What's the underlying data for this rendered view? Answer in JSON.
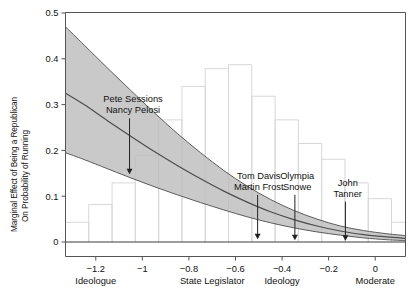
{
  "chart_data": {
    "type": "line",
    "title": "",
    "subtitle": "",
    "xlabel": "Ideology",
    "ylabel_line1": "Marginal Effect of Being a Republican",
    "ylabel_line2": "On Probability of Running",
    "xlim": [
      -1.33,
      0.13
    ],
    "ylim": [
      0,
      0.5
    ],
    "grid": false,
    "legend": "none",
    "xticks": [
      -1.2,
      -1,
      -0.8,
      -0.6,
      -0.4,
      -0.2,
      0
    ],
    "xticklabels": [
      "−1.2",
      "−1",
      "−0.8",
      "−0.6",
      "−0.4",
      "−0.2",
      "0"
    ],
    "yticks": [
      0,
      0.1,
      0.2,
      0.3,
      0.4,
      0.5
    ],
    "yticklabels": [
      "0",
      "0.1",
      "0.2",
      "0.3",
      "0.4",
      "0.5"
    ],
    "x_anchor_labels": [
      {
        "text": "Ideologue",
        "x": -1.2
      },
      {
        "text": "State Legislator",
        "x": -0.7
      },
      {
        "text": "Moderate",
        "x": 0.0
      }
    ],
    "series": [
      {
        "name": "Marginal effect (point estimate)",
        "x": [
          -1.33,
          -1.25,
          -1.15,
          -1.05,
          -0.95,
          -0.85,
          -0.75,
          -0.65,
          -0.55,
          -0.45,
          -0.35,
          -0.25,
          -0.15,
          -0.05,
          0.05,
          0.13
        ],
        "values": [
          0.325,
          0.3,
          0.265,
          0.231,
          0.198,
          0.167,
          0.138,
          0.111,
          0.087,
          0.066,
          0.049,
          0.035,
          0.024,
          0.016,
          0.011,
          0.008
        ]
      },
      {
        "name": "95% CI upper",
        "x": [
          -1.33,
          -1.25,
          -1.15,
          -1.05,
          -0.95,
          -0.85,
          -0.75,
          -0.65,
          -0.55,
          -0.45,
          -0.35,
          -0.25,
          -0.15,
          -0.05,
          0.05,
          0.13
        ],
        "values": [
          0.47,
          0.43,
          0.38,
          0.331,
          0.283,
          0.237,
          0.195,
          0.156,
          0.122,
          0.093,
          0.069,
          0.05,
          0.035,
          0.025,
          0.018,
          0.014
        ]
      },
      {
        "name": "95% CI lower",
        "x": [
          -1.33,
          -1.25,
          -1.15,
          -1.05,
          -0.95,
          -0.85,
          -0.75,
          -0.65,
          -0.55,
          -0.45,
          -0.35,
          -0.25,
          -0.15,
          -0.05,
          0.05,
          0.13
        ],
        "values": [
          0.195,
          0.18,
          0.16,
          0.14,
          0.121,
          0.103,
          0.086,
          0.07,
          0.055,
          0.042,
          0.031,
          0.022,
          0.015,
          0.009,
          0.005,
          0.003
        ]
      }
    ],
    "histogram": {
      "name": "Distribution of ideology scores",
      "note": "background frequency histogram, unlabeled secondary axis",
      "bin_edges": [
        -1.33,
        -1.23,
        -1.13,
        -1.03,
        -0.93,
        -0.83,
        -0.73,
        -0.63,
        -0.53,
        -0.43,
        -0.33,
        -0.23,
        -0.13,
        -0.03,
        0.07,
        0.13
      ],
      "bin_heights_rel": [
        0.1,
        0.19,
        0.3,
        0.44,
        0.62,
        0.79,
        0.88,
        0.9,
        0.74,
        0.62,
        0.5,
        0.42,
        0.3,
        0.22,
        0.1
      ]
    },
    "annotations": [
      {
        "text_lines": [
          "Pete Sessions",
          "Nancy Pelosi"
        ],
        "arrow_x": -1.055,
        "arrow_y_tip": 0.148,
        "text_x": -1.04,
        "text_y": 0.305
      },
      {
        "text_lines": [
          "Tom Davis",
          "Martin Frost"
        ],
        "arrow_x": -0.505,
        "arrow_y_tip": 0.006,
        "text_x": -0.5,
        "text_y": 0.138
      },
      {
        "text_lines": [
          "Olympia",
          "Snowe"
        ],
        "arrow_x": -0.345,
        "arrow_y_tip": 0.004,
        "text_x": -0.335,
        "text_y": 0.138
      },
      {
        "text_lines": [
          "John",
          "Tanner"
        ],
        "arrow_x": -0.128,
        "arrow_y_tip": 0.003,
        "text_x": -0.118,
        "text_y": 0.123
      }
    ],
    "colors": {
      "band_fill": "#bdbdbd",
      "curve": "#4d4d4d",
      "axis": "#555555",
      "histogram_stroke": "#d7d7d7",
      "text": "#111111",
      "background": "#ffffff"
    }
  }
}
